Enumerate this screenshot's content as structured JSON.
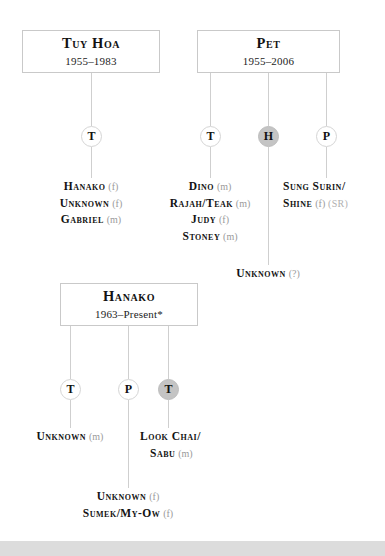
{
  "diagram": {
    "type": "family-tree",
    "accent_color": "#c4c4c4",
    "line_color": "#cfcfcf",
    "box_border_color": "#c9c9c9",
    "gender_marker_color": "#9a9a9a"
  },
  "boxes": [
    {
      "id": "tuy-hoa",
      "name": "Tuy Hoa",
      "dates": "1955–1983"
    },
    {
      "id": "pet",
      "name": "Pet",
      "dates": "1955–2006"
    },
    {
      "id": "hanako",
      "name": "Hanako",
      "dates": "1963–Present*"
    }
  ],
  "circles": [
    {
      "id": "tuy-hoa-t",
      "label": "T",
      "shaded": false
    },
    {
      "id": "pet-t",
      "label": "T",
      "shaded": false
    },
    {
      "id": "pet-h",
      "label": "H",
      "shaded": true
    },
    {
      "id": "pet-p",
      "label": "P",
      "shaded": false
    },
    {
      "id": "hanako-t1",
      "label": "T",
      "shaded": false
    },
    {
      "id": "hanako-p",
      "label": "P",
      "shaded": false
    },
    {
      "id": "hanako-t2",
      "label": "T",
      "shaded": true
    }
  ],
  "offspring": [
    {
      "id": "tuy-hoa-t-children",
      "lines": [
        {
          "name": "Hanako",
          "gender": "(f)",
          "tag": ""
        },
        {
          "name": "Unknown",
          "gender": "(f)",
          "tag": ""
        },
        {
          "name": "Gabriel",
          "gender": "(m)",
          "tag": ""
        }
      ]
    },
    {
      "id": "pet-t-children",
      "lines": [
        {
          "name": "Dino",
          "gender": "(m)",
          "tag": ""
        },
        {
          "name": "Rajah/Teak",
          "gender": "(m)",
          "tag": ""
        },
        {
          "name": "Judy",
          "gender": "(f)",
          "tag": ""
        },
        {
          "name": "Stoney",
          "gender": "(m)",
          "tag": ""
        }
      ]
    },
    {
      "id": "pet-p-children",
      "lines": [
        {
          "name": "Sung Surin/",
          "gender": "",
          "tag": ""
        },
        {
          "name": "Shine",
          "gender": "(f)",
          "tag": "(SR)"
        }
      ]
    },
    {
      "id": "pet-h-children",
      "lines": [
        {
          "name": "Unknown",
          "gender": "(?)",
          "tag": ""
        }
      ]
    },
    {
      "id": "hanako-t1-children",
      "lines": [
        {
          "name": "Unknown",
          "gender": "(m)",
          "tag": ""
        }
      ]
    },
    {
      "id": "hanako-t2-children",
      "lines": [
        {
          "name": "Look Chai/",
          "gender": "",
          "tag": ""
        },
        {
          "name": "Sabu",
          "gender": "(m)",
          "tag": ""
        }
      ]
    },
    {
      "id": "hanako-p-children",
      "lines": [
        {
          "name": "Unknown",
          "gender": "(f)",
          "tag": ""
        },
        {
          "name": "Sumek/My-Ow",
          "gender": "(f)",
          "tag": ""
        }
      ]
    }
  ]
}
